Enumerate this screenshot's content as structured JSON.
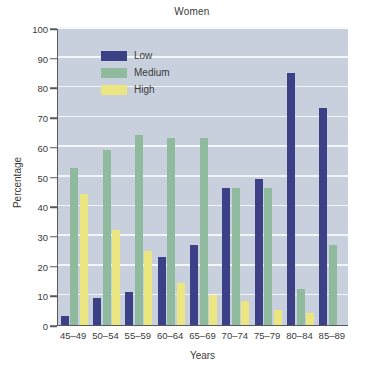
{
  "chart_data": {
    "type": "bar",
    "title": "Women",
    "xlabel": "Years",
    "ylabel": "Percentage",
    "ylim": [
      0,
      100
    ],
    "ytick_step": 10,
    "yticks": [
      0,
      10,
      20,
      30,
      40,
      50,
      60,
      70,
      80,
      90,
      100
    ],
    "grid": true,
    "legend_position": "top-left inside plot",
    "categories": [
      "45–49",
      "50–54",
      "55–59",
      "60–64",
      "65–69",
      "70–74",
      "75–79",
      "80–84",
      "85–89"
    ],
    "series": [
      {
        "name": "Low",
        "color": "#3c4187",
        "values": [
          3,
          9,
          11,
          23,
          27,
          46,
          49,
          85,
          73
        ]
      },
      {
        "name": "Medium",
        "color": "#8fba9e",
        "values": [
          53,
          59,
          64,
          63,
          63,
          46,
          46,
          12,
          27
        ]
      },
      {
        "name": "High",
        "color": "#ece680",
        "values": [
          44,
          32,
          25,
          14,
          10,
          8,
          5,
          4,
          0
        ]
      }
    ],
    "plot_background": "#c7d0dc",
    "gridline_color": "#f3f6f9",
    "axis_color": "#55585c"
  }
}
